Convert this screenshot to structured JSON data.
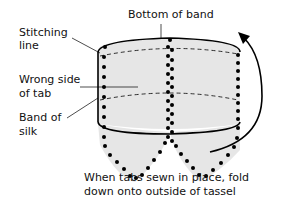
{
  "diagram": {
    "labels": {
      "bottom_of_band": "Bottom of band",
      "stitching_line_1": "Stitching",
      "stitching_line_2": "line",
      "wrong_side_1": "Wrong side",
      "wrong_side_2": "of tab",
      "band_of_silk_1": "Band of",
      "band_of_silk_2": "silk",
      "caption_1": "When tabs sewn in place, fold",
      "caption_2": "down onto outside of tassel"
    },
    "colors": {
      "fill": "#e6e6e6",
      "stroke": "#000000",
      "text": "#111111"
    }
  }
}
